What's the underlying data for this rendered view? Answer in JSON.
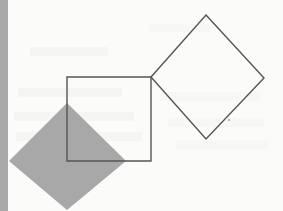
{
  "figure": {
    "canvas": {
      "width": 283,
      "height": 211
    },
    "background_color": "#fbfbfa",
    "paper_note": "scanned page with faint bleed-through ghost marks",
    "stroke_color": "#555555",
    "fill_gray": "#a8a8a8",
    "margin_strip_color": "#a9a9a9"
  },
  "shapes": {
    "margin_strip": {
      "label": "left margin strip",
      "x": 0,
      "y": 0,
      "width": 8,
      "height": 211,
      "color": "#a9a9a9"
    },
    "outlined_square": {
      "label": "outlined square",
      "points": "67,77 151,77 151,161 67,161",
      "side_length": 84,
      "stroke": "#555555",
      "stroke_width": 1.4,
      "fill": "none"
    },
    "outlined_diamond": {
      "label": "outlined tilted square (diamond)",
      "points": "206,15 264,78 206,139 151,77",
      "stroke": "#555555",
      "stroke_width": 1.4,
      "fill": "none"
    },
    "filled_diamond": {
      "label": "shaded tilted square (diamond)",
      "points": "67,103 126,161 67,210 9,161",
      "fill": "#a8a8a8",
      "stroke": "none"
    },
    "ink_dot": {
      "label": "small ink speck",
      "cx": 229,
      "cy": 120,
      "r": 0.9,
      "fill": "#9a9a9a"
    }
  },
  "ghost_marks": [
    {
      "x": 30,
      "y": 47,
      "width": 78,
      "height": 9,
      "opacity": 0.05
    },
    {
      "x": 18,
      "y": 88,
      "width": 104,
      "height": 9,
      "opacity": 0.05
    },
    {
      "x": 160,
      "y": 92,
      "width": 100,
      "height": 9,
      "opacity": 0.04
    },
    {
      "x": 14,
      "y": 112,
      "width": 120,
      "height": 9,
      "opacity": 0.05
    },
    {
      "x": 168,
      "y": 118,
      "width": 96,
      "height": 9,
      "opacity": 0.04
    },
    {
      "x": 16,
      "y": 132,
      "width": 126,
      "height": 9,
      "opacity": 0.05
    },
    {
      "x": 176,
      "y": 140,
      "width": 92,
      "height": 9,
      "opacity": 0.04
    },
    {
      "x": 150,
      "y": 24,
      "width": 60,
      "height": 8,
      "opacity": 0.03
    }
  ]
}
